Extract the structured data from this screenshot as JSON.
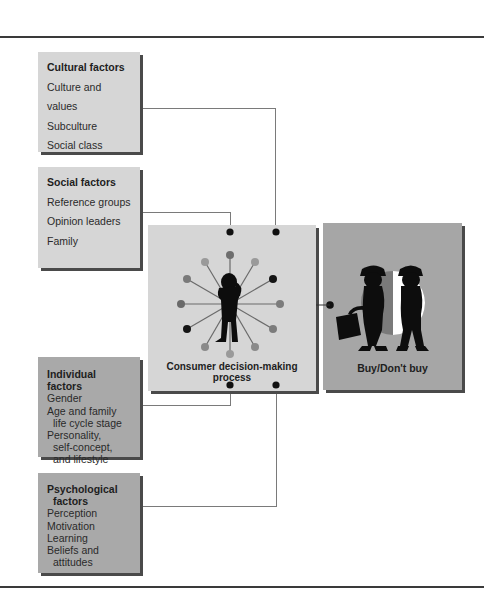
{
  "factors": {
    "cultural": {
      "title": "Cultural factors",
      "items": [
        "Culture and values",
        "Subculture",
        "Social class"
      ]
    },
    "social": {
      "title": "Social factors",
      "items": [
        "Reference groups",
        "Opinion leaders",
        "Family"
      ]
    },
    "individual": {
      "title": "Individual factors",
      "items": [
        "Gender",
        "Age and family",
        "life cycle stage",
        "Personality,",
        "self-concept,",
        "and lifestyle"
      ]
    },
    "psychological": {
      "title_line1": "Psychological",
      "title_line2": "factors",
      "items": [
        "Perception",
        "Motivation",
        "Learning",
        "Beliefs and",
        "attitudes"
      ]
    }
  },
  "process": {
    "label": "Consumer decision-making process",
    "hub_dot_colors": [
      "#6e6e6e",
      "#9a9a9a",
      "#151515",
      "#7c7c7c",
      "#7c7c7c",
      "#8a8a8a",
      "#9a9a9a",
      "#8a8a8a",
      "#151515",
      "#6a6a6a",
      "#7a7a7a",
      "#9a9a9a"
    ]
  },
  "outcome": {
    "label": "Buy/Don't buy"
  },
  "colors": {
    "light_box": "#d6d6d6",
    "mid_box": "#a9a9a9",
    "connector": "#7a7a7a",
    "node": "#111111"
  }
}
